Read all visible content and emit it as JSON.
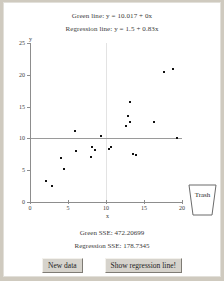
{
  "applet": {
    "equations": {
      "green_line": "Green line: y = 10.017 + 0x",
      "regression_line": "Regression line: y = 1.5 + 0.83x"
    },
    "statistics": {
      "green_sse": "Green SSE: 472.20699",
      "regression_sse": "Regression SSE: 178.7345"
    },
    "trash": {
      "label": "Trash"
    },
    "buttons": {
      "new_data": "New data",
      "show_regression": "Show regression line!"
    }
  },
  "chart_data": {
    "type": "scatter",
    "title": "",
    "xlabel": "x",
    "ylabel": "y",
    "xlim": [
      0,
      20
    ],
    "ylim": [
      0,
      25
    ],
    "xticks": [
      0,
      5,
      10,
      15,
      20
    ],
    "yticks": [
      0,
      5,
      10,
      15,
      20,
      25
    ],
    "grid": false,
    "point_color": "#111111",
    "green_line_color": "#9a9a9a",
    "vertical_gridline_x": 10,
    "green_line_y": 10.017,
    "regression_intercept": 1.5,
    "regression_slope": 0.83,
    "points": [
      {
        "x": 2.1,
        "y": 3.3
      },
      {
        "x": 2.9,
        "y": 2.5
      },
      {
        "x": 4.1,
        "y": 6.9
      },
      {
        "x": 4.5,
        "y": 5.2
      },
      {
        "x": 5.9,
        "y": 11.1
      },
      {
        "x": 6.1,
        "y": 8.0
      },
      {
        "x": 8.0,
        "y": 7.0
      },
      {
        "x": 8.2,
        "y": 8.6
      },
      {
        "x": 8.5,
        "y": 8.1
      },
      {
        "x": 9.3,
        "y": 10.3
      },
      {
        "x": 10.4,
        "y": 8.4
      },
      {
        "x": 10.6,
        "y": 8.6
      },
      {
        "x": 12.6,
        "y": 11.9
      },
      {
        "x": 12.9,
        "y": 13.6
      },
      {
        "x": 13.1,
        "y": 12.6
      },
      {
        "x": 13.2,
        "y": 15.8
      },
      {
        "x": 13.6,
        "y": 7.6
      },
      {
        "x": 13.9,
        "y": 7.4
      },
      {
        "x": 16.3,
        "y": 12.6
      },
      {
        "x": 17.6,
        "y": 20.5
      },
      {
        "x": 18.8,
        "y": 20.9
      },
      {
        "x": 19.4,
        "y": 10.0
      }
    ]
  }
}
